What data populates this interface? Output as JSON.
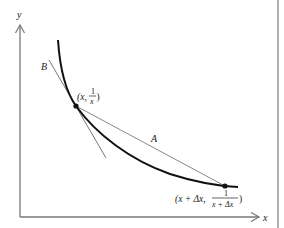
{
  "figure": {
    "type": "secant-and-tangent-to-reciprocal-curve",
    "curve": "y = 1/x",
    "axes": {
      "x_label": "x",
      "y_label": "y"
    },
    "lines": {
      "secant_label": "A",
      "tangent_label": "B"
    },
    "points": [
      {
        "name": "point-x",
        "label_prefix": "(x, ",
        "frac_num": "1",
        "frac_den": "x",
        "label_suffix": ")"
      },
      {
        "name": "point-x-plus-dx",
        "label_prefix": "(x + Δx, ",
        "frac_num": "1",
        "frac_den": "x + Δx",
        "label_suffix": ")"
      }
    ],
    "colors": {
      "curve": "#111111",
      "axes": "#777777",
      "secant": "#888888",
      "tangent": "#777777",
      "border": "#999999"
    }
  }
}
